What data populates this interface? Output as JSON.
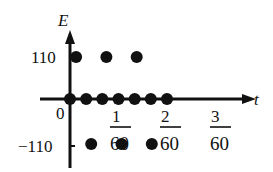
{
  "chart_data": {
    "type": "scatter",
    "title": "",
    "xlabel": "t",
    "ylabel": "E",
    "y_ticks": [
      {
        "value": 110,
        "label": "110"
      },
      {
        "value": -110,
        "label": "−110"
      }
    ],
    "origin_label": "0",
    "x_ticks": [
      {
        "value": 0.016667,
        "label_num": "1",
        "label_den": "60"
      },
      {
        "value": 0.033333,
        "label_num": "2",
        "label_den": "60"
      },
      {
        "value": 0.05,
        "label_num": "3",
        "label_den": "60"
      }
    ],
    "series": [
      {
        "name": "E=0",
        "points": [
          [
            0,
            0
          ],
          [
            0.005556,
            0
          ],
          [
            0.011111,
            0
          ],
          [
            0.016667,
            0
          ],
          [
            0.022222,
            0
          ],
          [
            0.027778,
            0
          ],
          [
            0.033333,
            0
          ]
        ]
      },
      {
        "name": "E=110",
        "points": [
          [
            0.002083,
            110
          ],
          [
            0.0125,
            110
          ],
          [
            0.022917,
            110
          ]
        ]
      },
      {
        "name": "E=-110",
        "points": [
          [
            0.007292,
            -110
          ],
          [
            0.017708,
            -110
          ],
          [
            0.028125,
            -110
          ]
        ]
      }
    ],
    "grid": false,
    "legend": "none",
    "color": "#111111"
  },
  "labels": {
    "y_axis": "E",
    "x_axis": "t",
    "origin": "0",
    "y_pos": "110",
    "y_neg": "−110",
    "frac1_num": "1",
    "frac1_den": "60",
    "frac2_num": "2",
    "frac2_den": "60",
    "frac3_num": "3",
    "frac3_den": "60"
  }
}
